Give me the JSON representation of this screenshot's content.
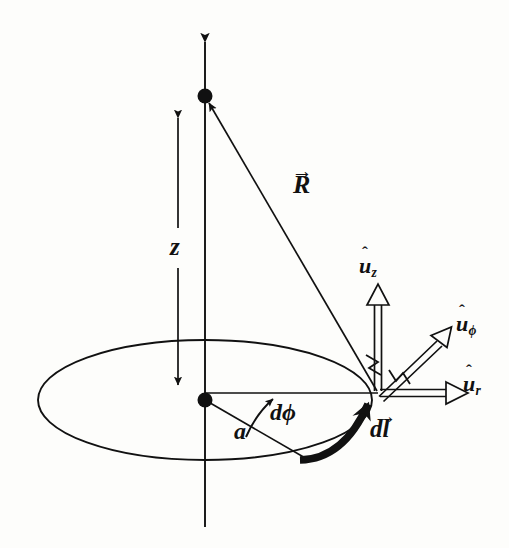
{
  "figure": {
    "type": "physics-vector-diagram",
    "background_color": "#fdfdfb",
    "ink_color": "#111111"
  },
  "labels": {
    "z_distance": "z",
    "radius": "a",
    "angle_increment_d": "d",
    "angle_increment_phi": "ϕ",
    "position_vector": "R",
    "line_element_d": "d",
    "line_element_l": "l",
    "unit_vector_u": "u",
    "unit_z_sub": "z",
    "unit_phi_sub": "ϕ",
    "unit_r_sub": "r",
    "hat_mark": "ˆ",
    "vector_mark": "→"
  },
  "geometry": {
    "axis_x": 205,
    "axis_top_y": 28,
    "axis_bottom_y": 527,
    "field_point": {
      "x": 205,
      "y": 96,
      "r": 7
    },
    "origin_point": {
      "x": 205,
      "y": 400,
      "r": 7
    },
    "loop": {
      "cx": 205,
      "cy": 400,
      "rx": 167,
      "ry": 60
    },
    "source_point": {
      "x": 378,
      "y": 393
    },
    "z_dim_arrow": {
      "x": 178,
      "y_top": 105,
      "y_bottom": 397,
      "label_y": 248
    },
    "radius_line_end": {
      "x": 305,
      "y": 458
    },
    "unit_z_tip": {
      "x": 378,
      "y": 286
    },
    "unit_phi_tip": {
      "x": 452,
      "y": 318
    },
    "unit_r_tip": {
      "x": 470,
      "y": 393
    }
  },
  "label_positions": {
    "z": {
      "x": 170,
      "y": 236
    },
    "a": {
      "x": 236,
      "y": 432
    },
    "dphi": {
      "x": 270,
      "y": 403
    },
    "R": {
      "x": 293,
      "y": 175
    },
    "dl": {
      "x": 372,
      "y": 419
    },
    "uz": {
      "x": 360,
      "y": 257
    },
    "uphi": {
      "x": 457,
      "y": 315
    },
    "ur": {
      "x": 463,
      "y": 375
    }
  }
}
